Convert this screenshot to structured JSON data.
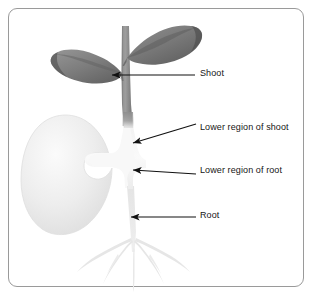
{
  "diagram": {
    "background_color": "#ffffff",
    "border_color": "#9a9a9a",
    "label_text_color": "#161616",
    "arrow_color": "#111111",
    "parts": {
      "leaf_fill": "#7d7d7d",
      "leaf_edge": "#5d5d5d",
      "stem_fill": "#8d8d8d",
      "seed_fill": "#ededed",
      "seed_edge": "#dcdcdc",
      "root_fill": "#e2e2e2",
      "hypocotyl_fill": "#f4f4f4"
    },
    "labels": [
      {
        "id": "shoot",
        "text": "Shoot",
        "arrow_tip_x": 112,
        "arrow_tip_y": 75,
        "arrow_tail_x": 195,
        "arrow_tail_y": 75
      },
      {
        "id": "lower-region-of-shoot",
        "text": "Lower region of shoot",
        "arrow_tip_x": 133,
        "arrow_tip_y": 143,
        "arrow_tail_x": 196,
        "arrow_tail_y": 124
      },
      {
        "id": "lower-region-of-root",
        "text": "Lower region of root",
        "arrow_tip_x": 133,
        "arrow_tip_y": 170,
        "arrow_tail_x": 196,
        "arrow_tail_y": 174
      },
      {
        "id": "root",
        "text": "Root",
        "arrow_tip_x": 131,
        "arrow_tip_y": 217,
        "arrow_tail_x": 196,
        "arrow_tail_y": 217
      }
    ],
    "structures": [
      {
        "id": "upper-right-leaf",
        "name": "leaf"
      },
      {
        "id": "lower-left-leaf",
        "name": "leaf"
      },
      {
        "id": "stem",
        "name": "shoot-stem"
      },
      {
        "id": "cotyledon",
        "name": "seed-cotyledon"
      },
      {
        "id": "hypocotyl",
        "name": "lower-region"
      },
      {
        "id": "taproot",
        "name": "root-system"
      }
    ]
  }
}
